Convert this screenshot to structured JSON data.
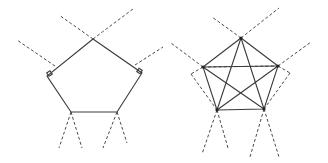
{
  "figure": {
    "panels": [
      {
        "name": "left-pentagon",
        "description": "Pentagon with dashed extension lines and right-angle markers",
        "vertices": [
          [
            93,
            39
          ],
          [
            142,
            73
          ],
          [
            117,
            112
          ],
          [
            71,
            112
          ],
          [
            47,
            76
          ]
        ],
        "dashed": [
          [
            [
              93,
              39
            ],
            [
              59,
              15
            ]
          ],
          [
            [
              93,
              39
            ],
            [
              133,
              9
            ]
          ],
          [
            [
              55,
              66
            ],
            [
              17,
              40
            ]
          ],
          [
            [
              135,
              65
            ],
            [
              163,
              47
            ]
          ],
          [
            [
              71,
              112
            ],
            [
              59,
              148
            ]
          ],
          [
            [
              71,
              112
            ],
            [
              82,
              148
            ]
          ],
          [
            [
              117,
              112
            ],
            [
              103,
              148
            ]
          ],
          [
            [
              117,
              112
            ],
            [
              127,
              143
            ]
          ]
        ],
        "right_angle_markers": [
          [
            47,
            76
          ],
          [
            142,
            73
          ]
        ]
      },
      {
        "name": "right-pentagon",
        "description": "Pentagon with all diagonals (pentagram) and dashed construction lines",
        "vertices": [
          [
            241,
            38
          ],
          [
            278,
            66
          ],
          [
            264,
            109
          ],
          [
            217,
            110
          ],
          [
            203,
            67
          ]
        ],
        "dashed": [
          [
            [
              241,
              38
            ],
            [
              212,
              17
            ]
          ],
          [
            [
              241,
              38
            ],
            [
              279,
              8
            ]
          ],
          [
            [
              203,
              67
            ],
            [
              171,
              43
            ]
          ],
          [
            [
              278,
              66
            ],
            [
              311,
              42
            ]
          ],
          [
            [
              203,
              67
            ],
            [
              278,
              66
            ]
          ],
          [
            [
              203,
              67
            ],
            [
              191,
              74
            ]
          ],
          [
            [
              191,
              74
            ],
            [
              217,
              110
            ]
          ],
          [
            [
              278,
              66
            ],
            [
              290,
              73
            ]
          ],
          [
            [
              290,
              73
            ],
            [
              264,
              109
            ]
          ],
          [
            [
              217,
              110
            ],
            [
              202,
              154
            ]
          ],
          [
            [
              217,
              110
            ],
            [
              228,
              148
            ]
          ],
          [
            [
              264,
              109
            ],
            [
              250,
              157
            ]
          ],
          [
            [
              264,
              109
            ],
            [
              279,
              157
            ]
          ]
        ]
      }
    ]
  }
}
